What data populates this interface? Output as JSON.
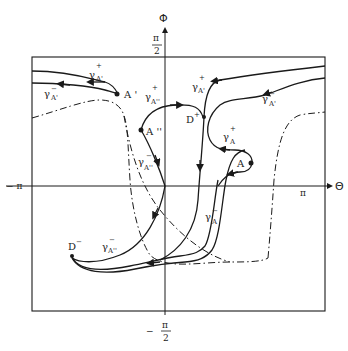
{
  "diagram": {
    "axes": {
      "horizontal_label": "Θ",
      "vertical_label": "Φ",
      "left_tick": "− π",
      "right_tick": "π",
      "top_tick_num": "π",
      "top_tick_den": "2",
      "bottom_tick_sign": "−",
      "bottom_tick_num": "π",
      "bottom_tick_den": "2"
    },
    "points": [
      {
        "id": "A",
        "label": "A"
      },
      {
        "id": "A1",
        "label": "A '"
      },
      {
        "id": "A2",
        "label": "A ''"
      },
      {
        "id": "Dplus",
        "label": "D",
        "sup": "+"
      },
      {
        "id": "Dminus",
        "label": "D",
        "sup": "−"
      }
    ],
    "curves": {
      "gA1_plus_left": {
        "base": "γ",
        "sup": "+",
        "sub": "A'"
      },
      "gA1_minus_left": {
        "base": "γ",
        "sup": "−",
        "sub": "A'"
      },
      "gA2_plus": {
        "base": "γ",
        "sup": "+",
        "sub": "A''"
      },
      "gA2_minus_upper": {
        "base": "γ",
        "sup": "−",
        "sub": "A''"
      },
      "gA2_minus_lower": {
        "base": "γ",
        "sup": "−",
        "sub": "A''"
      },
      "gA1_plus_right": {
        "base": "γ",
        "sup": "+",
        "sub": "A'"
      },
      "gA1_minus_right": {
        "base": "γ",
        "sup": "−",
        "sub": "A'"
      },
      "gA_plus": {
        "base": "γ",
        "sup": "+",
        "sub": "A"
      },
      "gA_minus": {
        "base": "γ",
        "sup": "−",
        "sub": "A"
      }
    }
  }
}
